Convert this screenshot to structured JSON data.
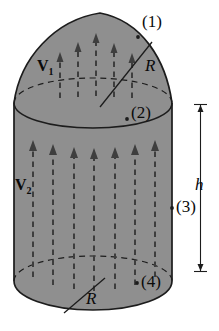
{
  "figure": {
    "colors": {
      "background": "#ffffff",
      "solid_fill": "#8f8f8f",
      "outline": "#1c1c1c",
      "arrow": "#3e3e3e"
    },
    "labels": {
      "v1_base": "V",
      "v1_sub": "1",
      "v2_base": "V",
      "v2_sub": "2",
      "point1": "(1)",
      "point2": "(2)",
      "point3": "(3)",
      "point4": "(4)",
      "radius_top": "R",
      "radius_bottom": "R",
      "height": "h"
    }
  }
}
